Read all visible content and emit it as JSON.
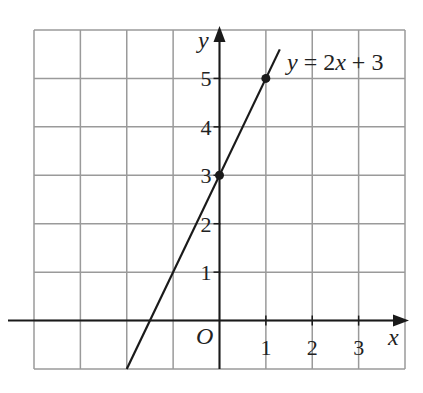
{
  "chart_data": {
    "type": "line",
    "title": "",
    "equation_label": "y = 2x + 3",
    "xlabel": "x",
    "ylabel": "y",
    "origin_label": "O",
    "xlim": [
      -4,
      4
    ],
    "ylim": [
      -1,
      6
    ],
    "grid": true,
    "x_ticks": [
      1,
      2,
      3
    ],
    "x_tick_labels": [
      "1",
      "2",
      "3"
    ],
    "y_ticks": [
      1,
      2,
      3,
      4,
      5
    ],
    "y_tick_labels": [
      "1",
      "2",
      "3",
      "4",
      "5"
    ],
    "series": [
      {
        "name": "y = 2x + 3",
        "slope": 2,
        "intercept": 3,
        "x": [
          -2,
          1.3
        ],
        "y": [
          -1,
          5.6
        ]
      }
    ],
    "marked_points": [
      {
        "x": 0,
        "y": 3
      },
      {
        "x": 1,
        "y": 5
      }
    ]
  },
  "colors": {
    "grid": "#9a9a9a",
    "axis": "#1a1a1a",
    "line": "#1a1a1a",
    "background": "#ffffff"
  }
}
